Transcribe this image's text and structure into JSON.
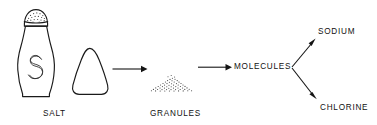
{
  "diagram": {
    "background_color": "#ffffff",
    "ink_color": "#141414",
    "labels": {
      "salt": "SALT",
      "granules": "GRANULES",
      "molecules": "MOLECULES",
      "sodium": "SODIUM",
      "chlorine": "CHLORINE"
    },
    "nodes": [
      {
        "id": "salt",
        "label": "SALT",
        "kind": "illustration-salt-shaker-and-cone"
      },
      {
        "id": "granules",
        "label": "GRANULES",
        "kind": "illustration-stippled-mound"
      },
      {
        "id": "molecules",
        "label": "MOLECULES",
        "kind": "text"
      },
      {
        "id": "sodium",
        "label": "SODIUM",
        "kind": "text"
      },
      {
        "id": "chlorine",
        "label": "CHLORINE",
        "kind": "text"
      }
    ],
    "edges": [
      {
        "from": "salt",
        "to": "granules",
        "style": "arrow"
      },
      {
        "from": "granules",
        "to": "molecules",
        "style": "arrow"
      },
      {
        "from": "molecules",
        "to": "sodium",
        "style": "arrow"
      },
      {
        "from": "molecules",
        "to": "chlorine",
        "style": "arrow"
      }
    ],
    "shaker": {
      "monogram": "S"
    }
  }
}
